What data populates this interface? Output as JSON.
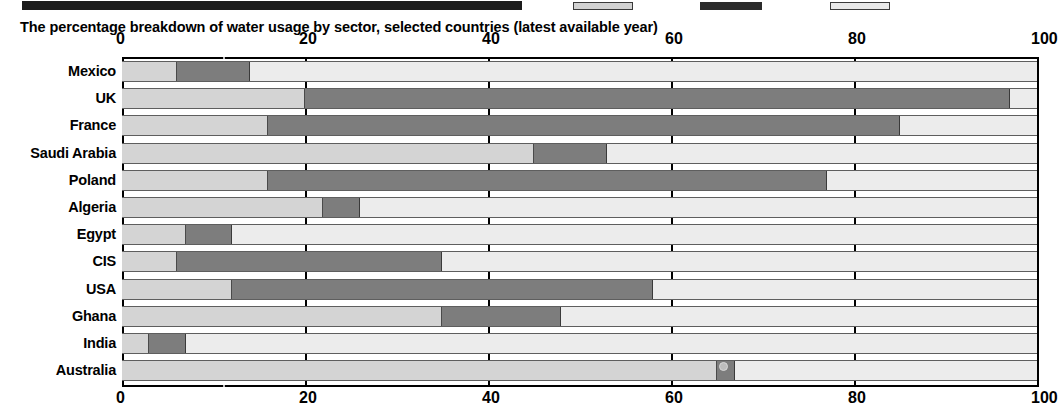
{
  "caption": "The percentage breakdown of water usage by sector, selected countries (latest available year)",
  "legend": {
    "chip_domestic": "domestic-swatch",
    "chip_industry": "industry-swatch",
    "chip_agriculture": "agriculture-swatch"
  },
  "axis": {
    "ticks": [
      "0",
      "20",
      "40",
      "60",
      "80",
      "100"
    ],
    "tick_values": [
      0,
      20,
      40,
      60,
      80,
      100
    ]
  },
  "colors": {
    "domestic": "#d4d4d4",
    "industry": "#7d7d7d",
    "agriculture": "#ececec",
    "axis": "#000000",
    "background": "#ffffff"
  },
  "chart_data": {
    "type": "bar",
    "orientation": "horizontal",
    "stacked": true,
    "title": "The percentage breakdown of water usage by sector, selected countries (latest available year)",
    "xlabel": "",
    "ylabel": "",
    "xlim": [
      0,
      100
    ],
    "grid": true,
    "legend_position": "top",
    "xticks": [
      0,
      20,
      40,
      60,
      80,
      100
    ],
    "categories": [
      "Mexico",
      "UK",
      "France",
      "Saudi Arabia",
      "Poland",
      "Algeria",
      "Egypt",
      "CIS",
      "USA",
      "Ghana",
      "India",
      "Australia"
    ],
    "series": [
      {
        "name": "Domestic",
        "values": [
          6,
          20,
          16,
          45,
          16,
          22,
          7,
          6,
          12,
          35,
          3,
          65
        ]
      },
      {
        "name": "Industry",
        "values": [
          8,
          77,
          69,
          8,
          61,
          4,
          5,
          29,
          46,
          13,
          4,
          2
        ]
      },
      {
        "name": "Agriculture",
        "values": [
          86,
          3,
          15,
          47,
          23,
          74,
          88,
          65,
          42,
          52,
          93,
          33
        ]
      }
    ],
    "rows": [
      {
        "label": "Mexico",
        "domestic": 6,
        "industry": 8,
        "agriculture": 86
      },
      {
        "label": "UK",
        "domestic": 20,
        "industry": 77,
        "agriculture": 3
      },
      {
        "label": "France",
        "domestic": 16,
        "industry": 69,
        "agriculture": 15
      },
      {
        "label": "Saudi Arabia",
        "domestic": 45,
        "industry": 8,
        "agriculture": 47
      },
      {
        "label": "Poland",
        "domestic": 16,
        "industry": 61,
        "agriculture": 23
      },
      {
        "label": "Algeria",
        "domestic": 22,
        "industry": 4,
        "agriculture": 74
      },
      {
        "label": "Egypt",
        "domestic": 7,
        "industry": 5,
        "agriculture": 88
      },
      {
        "label": "CIS",
        "domestic": 6,
        "industry": 29,
        "agriculture": 65
      },
      {
        "label": "USA",
        "domestic": 12,
        "industry": 46,
        "agriculture": 42
      },
      {
        "label": "Ghana",
        "domestic": 35,
        "industry": 13,
        "agriculture": 52
      },
      {
        "label": "India",
        "domestic": 3,
        "industry": 4,
        "agriculture": 93
      },
      {
        "label": "Australia",
        "domestic": 65,
        "industry": 2,
        "agriculture": 33
      }
    ]
  }
}
